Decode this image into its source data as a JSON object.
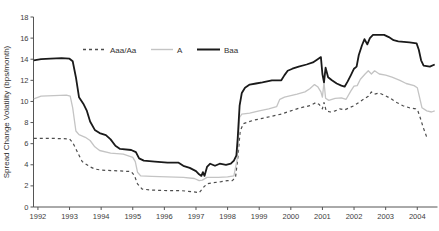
{
  "figure": {
    "background": "#ffffff",
    "axis_color": "#555555",
    "tick_label_color": "#3d3d3d"
  },
  "chart_data": {
    "type": "line",
    "title": "",
    "xlabel": "",
    "ylabel": "Spread Change Volatility (bps/month)",
    "xlim": [
      1991.86,
      2004.64
    ],
    "ylim": [
      0,
      18
    ],
    "x_ticks": [
      1992,
      1993,
      1994,
      1995,
      1996,
      1997,
      1998,
      1999,
      2000,
      2001,
      2002,
      2003,
      2004
    ],
    "y_ticks": [
      0,
      2,
      4,
      6,
      8,
      10,
      12,
      14,
      16,
      18
    ],
    "grid": false,
    "legend_position": "top-inside-horizontal",
    "series": [
      {
        "name": "Aaa/Aa",
        "color": "#4d4d4d",
        "dash": "3,3",
        "width": 1.2,
        "points": [
          [
            1991.87,
            6.5
          ],
          [
            1992.5,
            6.5
          ],
          [
            1993.0,
            6.45
          ],
          [
            1993.1,
            6.1
          ],
          [
            1993.2,
            5.5
          ],
          [
            1993.3,
            4.9
          ],
          [
            1993.4,
            4.3
          ],
          [
            1993.5,
            4.1
          ],
          [
            1993.65,
            3.8
          ],
          [
            1993.8,
            3.6
          ],
          [
            1994.0,
            3.5
          ],
          [
            1994.35,
            3.45
          ],
          [
            1994.7,
            3.4
          ],
          [
            1994.95,
            3.35
          ],
          [
            1995.05,
            3.0
          ],
          [
            1995.15,
            2.2
          ],
          [
            1995.3,
            1.7
          ],
          [
            1995.6,
            1.6
          ],
          [
            1996.1,
            1.55
          ],
          [
            1996.5,
            1.55
          ],
          [
            1996.9,
            1.45
          ],
          [
            1997.1,
            1.35
          ],
          [
            1997.25,
            1.9
          ],
          [
            1997.35,
            2.2
          ],
          [
            1997.55,
            2.3
          ],
          [
            1997.8,
            2.4
          ],
          [
            1998.0,
            2.5
          ],
          [
            1998.15,
            2.5
          ],
          [
            1998.25,
            2.8
          ],
          [
            1998.32,
            4.5
          ],
          [
            1998.4,
            7.2
          ],
          [
            1998.5,
            7.9
          ],
          [
            1998.8,
            8.2
          ],
          [
            1999.1,
            8.4
          ],
          [
            1999.4,
            8.6
          ],
          [
            1999.7,
            8.8
          ],
          [
            2000.0,
            9.1
          ],
          [
            2000.3,
            9.4
          ],
          [
            2000.6,
            9.6
          ],
          [
            2000.8,
            9.9
          ],
          [
            2000.9,
            9.7
          ],
          [
            2001.0,
            9.3
          ],
          [
            2001.05,
            9.9
          ],
          [
            2001.12,
            9.1
          ],
          [
            2001.25,
            9.0
          ],
          [
            2001.4,
            9.1
          ],
          [
            2001.55,
            9.3
          ],
          [
            2001.7,
            9.2
          ],
          [
            2001.85,
            9.4
          ],
          [
            2002.0,
            9.6
          ],
          [
            2002.15,
            9.9
          ],
          [
            2002.3,
            10.2
          ],
          [
            2002.45,
            10.5
          ],
          [
            2002.55,
            10.9
          ],
          [
            2002.65,
            10.7
          ],
          [
            2002.8,
            10.8
          ],
          [
            2002.95,
            10.6
          ],
          [
            2003.15,
            10.3
          ],
          [
            2003.35,
            9.9
          ],
          [
            2003.55,
            9.6
          ],
          [
            2003.75,
            9.4
          ],
          [
            2003.95,
            9.3
          ],
          [
            2004.02,
            9.1
          ],
          [
            2004.1,
            8.4
          ],
          [
            2004.18,
            7.6
          ],
          [
            2004.3,
            6.6
          ]
        ]
      },
      {
        "name": "A",
        "color": "#c4c4c4",
        "dash": "",
        "width": 1.3,
        "points": [
          [
            1991.87,
            10.25
          ],
          [
            1992.1,
            10.5
          ],
          [
            1992.5,
            10.55
          ],
          [
            1992.9,
            10.6
          ],
          [
            1993.02,
            10.5
          ],
          [
            1993.1,
            9.4
          ],
          [
            1993.2,
            7.2
          ],
          [
            1993.3,
            6.85
          ],
          [
            1993.5,
            6.6
          ],
          [
            1993.65,
            6.3
          ],
          [
            1993.8,
            5.7
          ],
          [
            1993.95,
            5.35
          ],
          [
            1994.3,
            5.1
          ],
          [
            1994.7,
            5.0
          ],
          [
            1995.0,
            4.7
          ],
          [
            1995.08,
            4.3
          ],
          [
            1995.15,
            3.3
          ],
          [
            1995.25,
            2.95
          ],
          [
            1995.6,
            2.9
          ],
          [
            1996.1,
            2.85
          ],
          [
            1996.6,
            2.8
          ],
          [
            1996.95,
            2.7
          ],
          [
            1997.1,
            2.5
          ],
          [
            1997.2,
            2.55
          ],
          [
            1997.35,
            2.8
          ],
          [
            1997.7,
            2.8
          ],
          [
            1998.0,
            2.85
          ],
          [
            1998.2,
            2.95
          ],
          [
            1998.3,
            4.5
          ],
          [
            1998.38,
            8.5
          ],
          [
            1998.45,
            8.8
          ],
          [
            1998.7,
            8.9
          ],
          [
            1999.0,
            9.1
          ],
          [
            1999.3,
            9.3
          ],
          [
            1999.55,
            9.5
          ],
          [
            1999.65,
            10.2
          ],
          [
            1999.8,
            10.4
          ],
          [
            2000.0,
            10.55
          ],
          [
            2000.2,
            10.7
          ],
          [
            2000.45,
            10.9
          ],
          [
            2000.6,
            11.2
          ],
          [
            2000.75,
            11.6
          ],
          [
            2000.85,
            11.4
          ],
          [
            2000.95,
            10.9
          ],
          [
            2001.0,
            10.4
          ],
          [
            2001.05,
            11.8
          ],
          [
            2001.1,
            10.3
          ],
          [
            2001.2,
            10.1
          ],
          [
            2001.4,
            10.3
          ],
          [
            2001.6,
            10.35
          ],
          [
            2001.75,
            10.2
          ],
          [
            2001.9,
            11.0
          ],
          [
            2002.0,
            11.45
          ],
          [
            2002.1,
            11.5
          ],
          [
            2002.2,
            12.1
          ],
          [
            2002.35,
            12.6
          ],
          [
            2002.45,
            12.9
          ],
          [
            2002.55,
            12.6
          ],
          [
            2002.65,
            12.9
          ],
          [
            2002.8,
            12.6
          ],
          [
            2003.0,
            12.5
          ],
          [
            2003.2,
            12.3
          ],
          [
            2003.45,
            12.0
          ],
          [
            2003.65,
            11.7
          ],
          [
            2003.9,
            11.5
          ],
          [
            2004.0,
            11.3
          ],
          [
            2004.08,
            10.3
          ],
          [
            2004.15,
            9.4
          ],
          [
            2004.3,
            9.1
          ],
          [
            2004.45,
            9.0
          ],
          [
            2004.55,
            9.1
          ]
        ]
      },
      {
        "name": "Baa",
        "color": "#1a1a1a",
        "dash": "",
        "width": 1.8,
        "points": [
          [
            1991.87,
            13.9
          ],
          [
            1992.1,
            14.0
          ],
          [
            1992.4,
            14.05
          ],
          [
            1992.75,
            14.1
          ],
          [
            1993.0,
            14.05
          ],
          [
            1993.1,
            13.8
          ],
          [
            1993.2,
            12.3
          ],
          [
            1993.3,
            10.4
          ],
          [
            1993.45,
            9.7
          ],
          [
            1993.55,
            9.1
          ],
          [
            1993.65,
            8.1
          ],
          [
            1993.8,
            7.3
          ],
          [
            1993.95,
            7.0
          ],
          [
            1994.15,
            6.8
          ],
          [
            1994.3,
            6.4
          ],
          [
            1994.45,
            5.8
          ],
          [
            1994.6,
            5.5
          ],
          [
            1994.95,
            5.4
          ],
          [
            1995.1,
            5.2
          ],
          [
            1995.2,
            4.6
          ],
          [
            1995.35,
            4.4
          ],
          [
            1995.7,
            4.3
          ],
          [
            1996.1,
            4.2
          ],
          [
            1996.45,
            4.2
          ],
          [
            1996.6,
            3.9
          ],
          [
            1996.8,
            3.7
          ],
          [
            1997.0,
            3.4
          ],
          [
            1997.1,
            3.1
          ],
          [
            1997.17,
            2.95
          ],
          [
            1997.22,
            3.3
          ],
          [
            1997.27,
            2.95
          ],
          [
            1997.35,
            3.8
          ],
          [
            1997.45,
            4.1
          ],
          [
            1997.6,
            3.9
          ],
          [
            1997.75,
            4.1
          ],
          [
            1997.95,
            4.0
          ],
          [
            1998.1,
            4.1
          ],
          [
            1998.2,
            4.4
          ],
          [
            1998.28,
            4.9
          ],
          [
            1998.32,
            6.5
          ],
          [
            1998.38,
            9.6
          ],
          [
            1998.45,
            10.8
          ],
          [
            1998.55,
            11.3
          ],
          [
            1998.7,
            11.6
          ],
          [
            1998.9,
            11.7
          ],
          [
            1999.1,
            11.8
          ],
          [
            1999.4,
            12.0
          ],
          [
            1999.7,
            12.0
          ],
          [
            1999.8,
            12.5
          ],
          [
            1999.9,
            12.9
          ],
          [
            2000.05,
            13.1
          ],
          [
            2000.25,
            13.3
          ],
          [
            2000.5,
            13.5
          ],
          [
            2000.7,
            13.7
          ],
          [
            2000.85,
            14.0
          ],
          [
            2000.95,
            14.2
          ],
          [
            2001.0,
            12.6
          ],
          [
            2001.05,
            11.8
          ],
          [
            2001.1,
            13.2
          ],
          [
            2001.18,
            12.3
          ],
          [
            2001.3,
            12.0
          ],
          [
            2001.45,
            11.7
          ],
          [
            2001.6,
            11.5
          ],
          [
            2001.7,
            11.4
          ],
          [
            2001.8,
            11.9
          ],
          [
            2001.9,
            12.5
          ],
          [
            2002.0,
            13.1
          ],
          [
            2002.08,
            13.3
          ],
          [
            2002.15,
            14.4
          ],
          [
            2002.25,
            15.3
          ],
          [
            2002.33,
            15.9
          ],
          [
            2002.42,
            15.4
          ],
          [
            2002.5,
            16.0
          ],
          [
            2002.6,
            16.3
          ],
          [
            2002.95,
            16.3
          ],
          [
            2003.1,
            16.1
          ],
          [
            2003.25,
            15.8
          ],
          [
            2003.4,
            15.7
          ],
          [
            2003.75,
            15.6
          ],
          [
            2003.98,
            15.5
          ],
          [
            2004.05,
            14.9
          ],
          [
            2004.12,
            13.9
          ],
          [
            2004.2,
            13.4
          ],
          [
            2004.4,
            13.3
          ],
          [
            2004.55,
            13.5
          ]
        ]
      }
    ]
  }
}
